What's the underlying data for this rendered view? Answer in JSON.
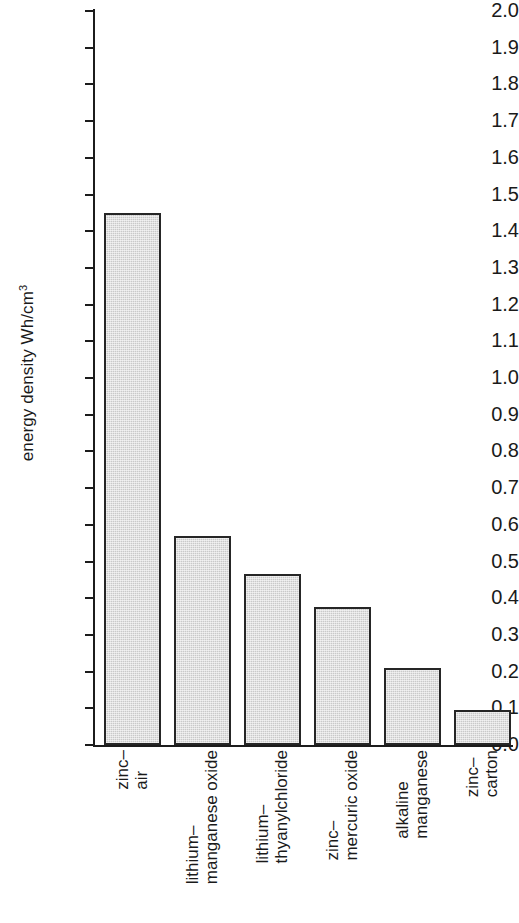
{
  "chart_data": {
    "type": "bar",
    "title": "",
    "xlabel": "",
    "ylabel": "energy density Wh/cm3",
    "ylabel_main": "energy density Wh/cm",
    "ylabel_sup": "3",
    "ylim": [
      0.0,
      2.0
    ],
    "ytick_step": 0.1,
    "grid": false,
    "legend": "none",
    "categories": [
      "zinc–air",
      "lithium–manganese oxide",
      "lithium–thyanylchloride",
      "zinc–mercuric oxide",
      "alkaline manganese",
      "zinc–carton"
    ],
    "category_lines": [
      [
        "zinc–",
        "air"
      ],
      [
        "lithium–",
        "manganese oxide"
      ],
      [
        "lithium–",
        "thyanylchloride"
      ],
      [
        "zinc–",
        "mercuric oxide"
      ],
      [
        "alkaline",
        "manganese"
      ],
      [
        "zinc–",
        "carton"
      ]
    ],
    "values": [
      1.45,
      0.57,
      0.465,
      0.375,
      0.21,
      0.095
    ],
    "yticks": [
      "0.0",
      "0.1",
      "0.2",
      "0.3",
      "0.4",
      "0.5",
      "0.6",
      "0.7",
      "0.8",
      "0.9",
      "1.0",
      "1.1",
      "1.2",
      "1.3",
      "1.4",
      "1.5",
      "1.6",
      "1.7",
      "1.8",
      "1.9",
      "2.0"
    ],
    "bar_fill_color": "#c9c9c9",
    "bar_border_color": "#262626",
    "axis_color": "#1c1c1c",
    "background_color": "#ffffff"
  }
}
